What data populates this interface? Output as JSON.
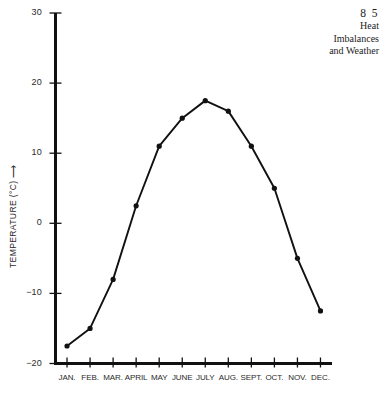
{
  "running_head": {
    "page_number": "8 5",
    "lines": [
      "Heat",
      "Imbalances",
      "and Weather"
    ]
  },
  "chart_data": {
    "type": "line",
    "title": "",
    "xlabel": "",
    "ylabel": "TEMPERATURE (°C)",
    "ylabel_arrow": "⟶",
    "categories": [
      "JAN.",
      "FEB.",
      "MAR.",
      "APRIL",
      "MAY",
      "JUNE",
      "JULY",
      "AUG.",
      "SEPT.",
      "OCT.",
      "NOV.",
      "DEC."
    ],
    "values": [
      -17.5,
      -15,
      -8,
      2.5,
      11,
      15,
      17.5,
      16,
      11,
      5,
      -5,
      -12.5
    ],
    "ylim": [
      -20,
      30
    ],
    "yticks": [
      30,
      20,
      10,
      0,
      -10,
      -20
    ],
    "ytick_labels": [
      "30",
      "20",
      "10",
      "0",
      "−10",
      "−20"
    ],
    "grid": false,
    "legend": false,
    "marker": "filled-circle",
    "line_color": "#111111",
    "marker_color": "#111111",
    "axis_color": "#111111"
  }
}
